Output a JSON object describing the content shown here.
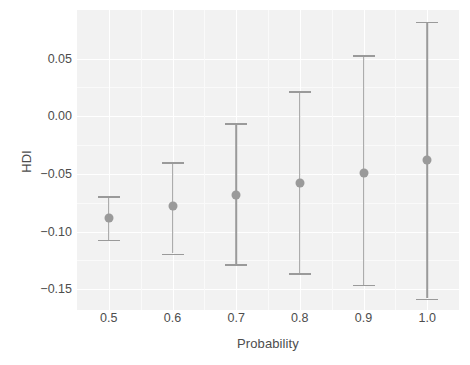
{
  "chart_data": {
    "type": "scatter",
    "title": "",
    "xlabel": "Probability",
    "ylabel": "HDI",
    "grid": true,
    "legend": null,
    "point_color": "#9a9a9a",
    "errorbar_color": "#9a9a9a",
    "panel_color": "#f2f2f2",
    "x": [
      0.5,
      0.6,
      0.7,
      0.8,
      0.9,
      1.0
    ],
    "xtick_labels": [
      "0.5",
      "0.6",
      "0.7",
      "0.8",
      "0.9",
      "1.0"
    ],
    "ytick_labels": [
      "0.05",
      "0.00",
      "−0.05",
      "−0.10",
      "−0.15"
    ],
    "ytick_values": [
      0.05,
      0.0,
      -0.05,
      -0.1,
      -0.15
    ],
    "xlim": [
      0.45,
      1.05
    ],
    "ylim": [
      -0.168,
      0.092
    ],
    "values": [
      -0.088,
      -0.078,
      -0.068,
      -0.058,
      -0.049,
      -0.038
    ],
    "ci_lower": [
      -0.107,
      -0.119,
      -0.128,
      -0.136,
      -0.146,
      -0.158
    ],
    "ci_upper": [
      -0.069,
      -0.04,
      -0.006,
      0.022,
      0.053,
      0.082
    ],
    "series": [
      {
        "name": "HDI",
        "points": [
          {
            "x": 0.5,
            "y": -0.088,
            "lower": -0.107,
            "upper": -0.069
          },
          {
            "x": 0.6,
            "y": -0.078,
            "lower": -0.119,
            "upper": -0.04
          },
          {
            "x": 0.7,
            "y": -0.068,
            "lower": -0.128,
            "upper": -0.006
          },
          {
            "x": 0.8,
            "y": -0.058,
            "lower": -0.136,
            "upper": 0.022
          },
          {
            "x": 0.9,
            "y": -0.049,
            "lower": -0.146,
            "upper": 0.053
          },
          {
            "x": 1.0,
            "y": -0.038,
            "lower": -0.158,
            "upper": 0.082
          }
        ]
      }
    ]
  }
}
